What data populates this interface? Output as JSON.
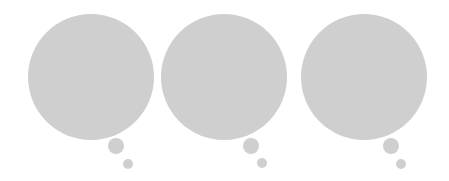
{
  "bubble_color": "#cfcfcf",
  "bubbles": [
    {
      "cx": 91,
      "cy": 77,
      "r": 63,
      "small": {
        "cx": 116,
        "cy": 146,
        "r": 8
      },
      "tiny": {
        "cx": 128,
        "cy": 164,
        "r": 5
      }
    },
    {
      "cx": 224,
      "cy": 77,
      "r": 63,
      "small": {
        "cx": 251,
        "cy": 146,
        "r": 8
      },
      "tiny": {
        "cx": 262,
        "cy": 163,
        "r": 5
      }
    },
    {
      "cx": 364,
      "cy": 77,
      "r": 63,
      "small": {
        "cx": 391,
        "cy": 146,
        "r": 8
      },
      "tiny": {
        "cx": 401,
        "cy": 164,
        "r": 5
      }
    }
  ]
}
